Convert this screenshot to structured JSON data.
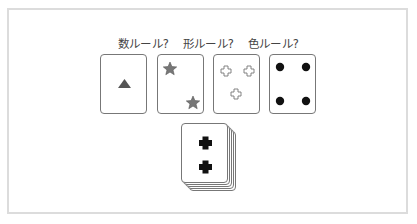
{
  "title_labels": [
    "数ルール?",
    "形ルール?",
    "色ルール?"
  ],
  "reference_cards": [
    {
      "count": 1,
      "shape": "triangle",
      "color": "#555555"
    },
    {
      "count": 2,
      "shape": "star",
      "color": "#777777"
    },
    {
      "count": 3,
      "shape": "cross",
      "color": "#ffffff"
    },
    {
      "count": 4,
      "shape": "circle",
      "color": "#111111"
    }
  ],
  "deck_card": {
    "count": 2,
    "shape": "cross",
    "color": "#111111"
  },
  "colors": {
    "frame_border": "#dcdcdc",
    "card_border": "#777777",
    "text": "#444444"
  }
}
